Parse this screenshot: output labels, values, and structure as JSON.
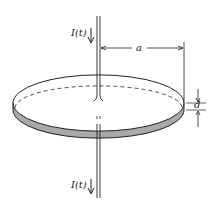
{
  "figure": {
    "labels": {
      "current_top": "I(t)",
      "current_bottom": "I(t)",
      "radius": "a",
      "separation": "d"
    },
    "colors": {
      "line": "#222222",
      "plate_fill": "#a9a9a9",
      "background": "#ffffff"
    }
  }
}
